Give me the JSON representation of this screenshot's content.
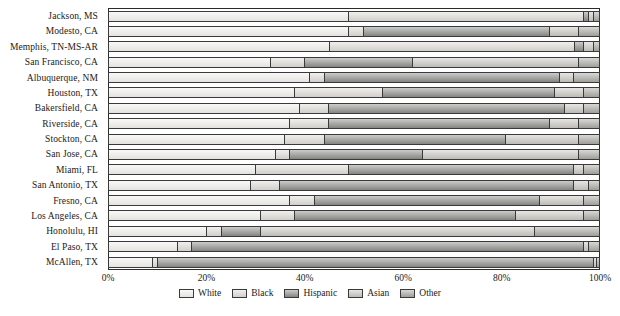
{
  "chart_data": {
    "type": "bar",
    "orientation": "horizontal",
    "stacked": true,
    "normalized": true,
    "title": "",
    "xlabel": "",
    "ylabel": "",
    "xlim": [
      0,
      100
    ],
    "grid": false,
    "legend_position": "bottom",
    "xticks": [
      "0%",
      "20%",
      "40%",
      "60%",
      "80%",
      "100%"
    ],
    "xtick_values": [
      0,
      20,
      40,
      60,
      80,
      100
    ],
    "series": [
      {
        "name": "White",
        "color": "#f2f1ee"
      },
      {
        "name": "Black",
        "color": "#dedcd7"
      },
      {
        "name": "Hispanic",
        "color": "#8d8d8a"
      },
      {
        "name": "Asian",
        "color": "#c9c7c2"
      },
      {
        "name": "Other",
        "color": "#a9a8a4"
      }
    ],
    "categories": [
      "Jackson, MS",
      "Modesto, CA",
      "Memphis, TN-MS-AR",
      "San Francisco, CA",
      "Albuquerque, NM",
      "Houston, TX",
      "Bakersfield, CA",
      "Riverside, CA",
      "Stockton, CA",
      "San Jose, CA",
      "Miami, FL",
      "San Antonio, TX",
      "Fresno, CA",
      "Los Angeles, CA",
      "Honolulu, HI",
      "El Paso, TX",
      "McAllen, TX"
    ],
    "values": [
      [
        49.0,
        48.0,
        1.0,
        1.0,
        1.0
      ],
      [
        49.0,
        3.0,
        38.0,
        6.0,
        4.0
      ],
      [
        45.0,
        50.0,
        2.0,
        2.0,
        1.0
      ],
      [
        33.0,
        7.0,
        22.0,
        34.0,
        4.0
      ],
      [
        41.0,
        3.0,
        48.0,
        3.0,
        5.0
      ],
      [
        38.0,
        18.0,
        35.0,
        6.0,
        3.0
      ],
      [
        39.0,
        6.0,
        48.0,
        4.0,
        3.0
      ],
      [
        37.0,
        8.0,
        45.0,
        6.0,
        4.0
      ],
      [
        36.0,
        8.0,
        37.0,
        15.0,
        4.0
      ],
      [
        34.0,
        3.0,
        27.0,
        32.0,
        4.0
      ],
      [
        30.0,
        19.0,
        46.0,
        2.0,
        3.0
      ],
      [
        29.0,
        6.0,
        60.0,
        3.0,
        2.0
      ],
      [
        37.0,
        5.0,
        46.0,
        9.0,
        3.0
      ],
      [
        31.0,
        7.0,
        45.0,
        14.0,
        3.0
      ],
      [
        20.0,
        3.0,
        8.0,
        56.0,
        13.0
      ],
      [
        14.0,
        3.0,
        80.0,
        1.0,
        2.0
      ],
      [
        9.0,
        1.0,
        89.0,
        0.6,
        0.4
      ]
    ]
  },
  "legend": {
    "items": [
      {
        "label": "White"
      },
      {
        "label": "Black"
      },
      {
        "label": "Hispanic"
      },
      {
        "label": "Asian"
      },
      {
        "label": "Other"
      }
    ]
  },
  "caption": ""
}
